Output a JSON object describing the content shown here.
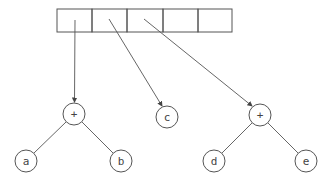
{
  "diagram": {
    "type": "array-of-expression-trees",
    "stroke_color": "#555555",
    "array": {
      "x": 57,
      "y": 9,
      "cell_width": 35,
      "height": 23,
      "cells": [
        "",
        "",
        "",
        "",
        ""
      ]
    },
    "nodes": [
      {
        "id": "plus1",
        "label": "+",
        "cx": 74,
        "cy": 114
      },
      {
        "id": "a",
        "label": "a",
        "cx": 26,
        "cy": 161
      },
      {
        "id": "b",
        "label": "b",
        "cx": 121,
        "cy": 161
      },
      {
        "id": "c",
        "label": "c",
        "cx": 167,
        "cy": 117
      },
      {
        "id": "plus2",
        "label": "+",
        "cx": 260,
        "cy": 115
      },
      {
        "id": "d",
        "label": "d",
        "cx": 214,
        "cy": 161
      },
      {
        "id": "e",
        "label": "e",
        "cx": 306,
        "cy": 161
      }
    ],
    "pointers": [
      {
        "from_cell": 0,
        "to": "plus1"
      },
      {
        "from_cell": 1,
        "to": "c"
      },
      {
        "from_cell": 2,
        "to": "plus2"
      }
    ],
    "edges": [
      {
        "from": "plus1",
        "to": "a"
      },
      {
        "from": "plus1",
        "to": "b"
      },
      {
        "from": "plus2",
        "to": "d"
      },
      {
        "from": "plus2",
        "to": "e"
      }
    ]
  }
}
